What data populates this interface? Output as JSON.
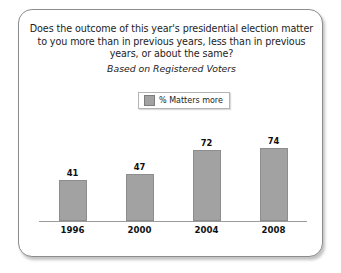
{
  "chart_data": {
    "type": "bar",
    "title": "Does the outcome of this year's presidential election matter to you more than in previous years, less than in previous years, or about the same?",
    "title_lines": [
      "Does the outcome of this year's presidential election matter",
      "to you more than in previous years, less than in previous",
      "years, or about the same?"
    ],
    "subtitle": "Based on Registered Voters",
    "categories": [
      "1996",
      "2000",
      "2004",
      "2008"
    ],
    "values": [
      41,
      47,
      72,
      74
    ],
    "series": [
      {
        "name": "% Matters more",
        "values": [
          41,
          47,
          72,
          74
        ],
        "color": "#a2a2a2"
      }
    ],
    "legend": {
      "position": "top-center",
      "entries": [
        {
          "label": "% Matters more",
          "color": "#a2a2a2"
        }
      ]
    },
    "xlabel": "",
    "ylabel": "",
    "ylim": [
      0,
      100
    ],
    "grid": false,
    "axis_line_color": "#9b9b9b",
    "value_labels_shown": true
  },
  "frame": {
    "border_color": "#8c8c8c",
    "background": "#ffffff"
  }
}
